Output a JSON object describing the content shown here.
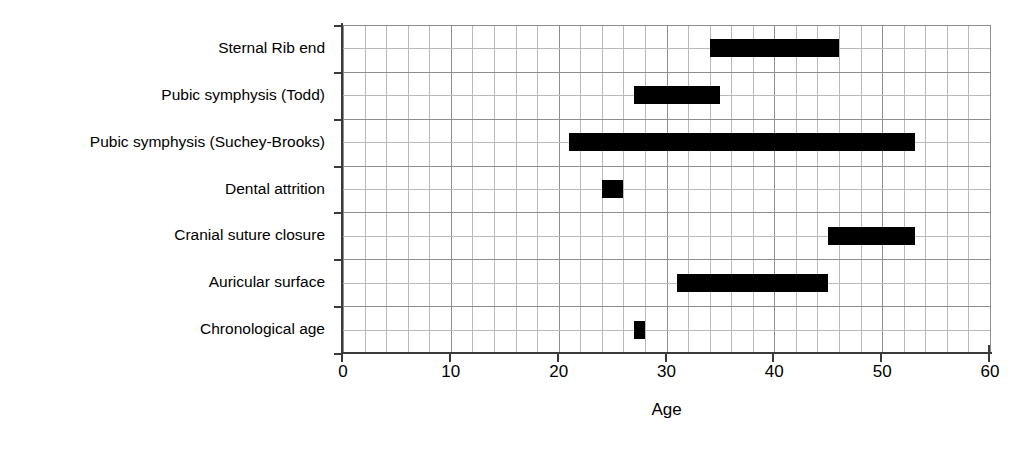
{
  "chart_data": {
    "type": "bar",
    "orientation": "horizontal",
    "title": "",
    "xlabel": "Age",
    "ylabel": "",
    "xlim": [
      0,
      60
    ],
    "xticks": [
      0,
      10,
      20,
      30,
      40,
      50,
      60
    ],
    "xtick_labels": [
      "0",
      "10",
      "20",
      "30",
      "40",
      "50",
      "60"
    ],
    "minor_gridline_step": 2,
    "grid": true,
    "legend": null,
    "bar_color": "#000000",
    "categories": [
      "Sternal Rib end",
      "Pubic symphysis (Todd)",
      "Pubic symphysis (Suchey-Brooks)",
      "Dental attrition",
      "Cranial suture closure",
      "Auricular surface",
      "Chronological  age"
    ],
    "ranges": [
      {
        "label": "Sternal Rib end",
        "start": 34,
        "end": 46
      },
      {
        "label": "Pubic symphysis (Todd)",
        "start": 27,
        "end": 35
      },
      {
        "label": "Pubic symphysis (Suchey-Brooks)",
        "start": 21,
        "end": 53
      },
      {
        "label": "Dental attrition",
        "start": 24,
        "end": 26
      },
      {
        "label": "Cranial suture closure",
        "start": 45,
        "end": 53
      },
      {
        "label": "Auricular surface",
        "start": 31,
        "end": 45
      },
      {
        "label": "Chronological  age",
        "start": 27,
        "end": 28
      }
    ]
  },
  "axis": {
    "x_title": "Age"
  }
}
